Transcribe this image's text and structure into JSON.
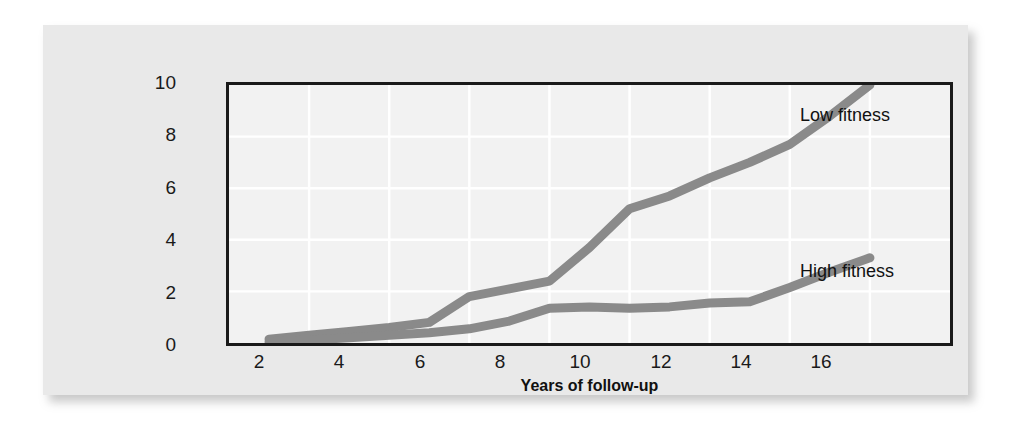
{
  "figure": {
    "background_color": "#e9e9e9",
    "plot_background_color": "#f2f2f2",
    "frame_color": "#1a1a1a",
    "gridline_color": "#ffffff",
    "series_color": "#8a8a8a"
  },
  "chart_data": {
    "type": "line",
    "title": "",
    "xlabel": "Years of follow-up",
    "ylabel": "Cumulative (percent) mortality",
    "xlim": [
      0,
      18
    ],
    "ylim": [
      0,
      10
    ],
    "xticks": [
      2,
      4,
      6,
      8,
      10,
      12,
      14,
      16
    ],
    "yticks": [
      0,
      2,
      4,
      6,
      8,
      10
    ],
    "grid": true,
    "legend_position": "inline-annotation",
    "series": [
      {
        "name": "Low fitness",
        "color": "#8a8a8a",
        "x": [
          1,
          2,
          3,
          4,
          5,
          6,
          7,
          8,
          9,
          10,
          11,
          12,
          13,
          14,
          15,
          16
        ],
        "values": [
          0.15,
          0.3,
          0.45,
          0.6,
          0.8,
          1.8,
          2.1,
          2.4,
          3.7,
          5.2,
          5.7,
          6.4,
          7.0,
          7.7,
          8.8,
          10.0
        ]
      },
      {
        "name": "High fitness",
        "color": "#8a8a8a",
        "x": [
          1,
          2,
          3,
          4,
          5,
          6,
          7,
          8,
          9,
          10,
          11,
          12,
          13,
          14,
          15,
          16
        ],
        "values": [
          0.05,
          0.12,
          0.2,
          0.3,
          0.4,
          0.55,
          0.85,
          1.35,
          1.4,
          1.35,
          1.4,
          1.55,
          1.6,
          2.15,
          2.75,
          3.3
        ]
      }
    ],
    "annotations": [
      {
        "text": "Low fitness",
        "x": 16.2,
        "y": 9.1
      },
      {
        "text": "High fitness",
        "x": 16.2,
        "y": 2.7
      }
    ]
  },
  "axis": {
    "y_tick_labels": [
      "10",
      "8",
      "6",
      "4",
      "2",
      "0"
    ],
    "x_tick_labels": [
      "2",
      "4",
      "6",
      "8",
      "10",
      "12",
      "14",
      "16"
    ]
  }
}
